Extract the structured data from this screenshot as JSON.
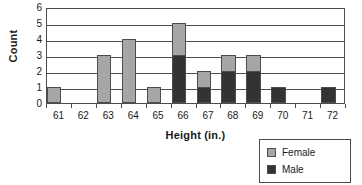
{
  "chart_data": {
    "type": "bar",
    "subtype": "stacked-bar-histogram",
    "title": "",
    "xlabel": "Height (in.)",
    "ylabel": "Count",
    "categories": [
      "61",
      "62",
      "63",
      "64",
      "65",
      "66",
      "67",
      "68",
      "69",
      "70",
      "71",
      "72"
    ],
    "series": [
      {
        "name": "Female",
        "color": "#a6a6a6",
        "values": [
          1,
          0,
          3,
          4,
          1,
          2,
          1,
          1,
          1,
          0,
          0,
          0
        ]
      },
      {
        "name": "Male",
        "color": "#333333",
        "values": [
          0,
          0,
          0,
          0,
          0,
          3,
          1,
          2,
          2,
          1,
          0,
          1
        ]
      }
    ],
    "totals": [
      1,
      0,
      3,
      4,
      1,
      5,
      2,
      3,
      3,
      1,
      0,
      1
    ],
    "ylim": [
      0,
      6
    ],
    "ytick_labels": [
      "0",
      "1",
      "2",
      "3",
      "4",
      "5",
      "6"
    ],
    "ytick_values": [
      0,
      1,
      2,
      3,
      4,
      5,
      6
    ],
    "grid": "horizontal",
    "legend_position": "bottom-right",
    "stack_order_bottom_to_top": [
      "Male",
      "Female"
    ]
  },
  "legend": {
    "items": [
      {
        "label": "Female",
        "color": "#a6a6a6"
      },
      {
        "label": "Male",
        "color": "#333333"
      }
    ]
  },
  "colors": {
    "female": "#a6a6a6",
    "male": "#333333",
    "axis": "#4d4d4d",
    "background": "#ffffff"
  }
}
